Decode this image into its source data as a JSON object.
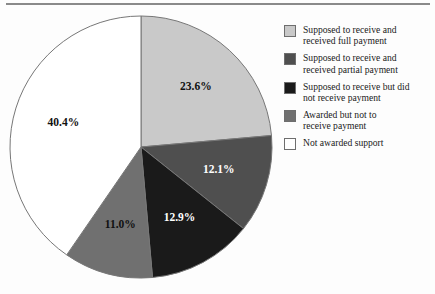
{
  "chart_data": {
    "type": "pie",
    "title": "",
    "subtitle": "",
    "xlabel": "",
    "ylabel": "",
    "legend_position": "right",
    "grid": false,
    "start_angle_deg": 90,
    "direction": "clockwise",
    "categories": [
      "Supposed to receive and received full payment",
      "Supposed to receive and received partial payment",
      "Supposed to receive but did not receive payment",
      "Awarded but not to receive payment",
      "Not awarded support"
    ],
    "values": [
      23.6,
      12.1,
      12.9,
      11.0,
      40.4
    ],
    "value_labels": [
      "23.6%",
      "12.1%",
      "12.9%",
      "11.0%",
      "40.4%"
    ],
    "colors": [
      "#c9c9c9",
      "#4f4f4f",
      "#1a1a1a",
      "#707070",
      "#ffffff"
    ],
    "label_text_colors": [
      "#111111",
      "#ffffff",
      "#ffffff",
      "#111111",
      "#111111"
    ],
    "slice_border_color": "#777777"
  },
  "legend": {
    "items": [
      {
        "label": "Supposed to receive and\nreceived full payment",
        "swatch": "#c9c9c9",
        "swatch_name": "legend-swatch-full-payment"
      },
      {
        "label": "Supposed to receive and\nreceived partial payment",
        "swatch": "#4f4f4f",
        "swatch_name": "legend-swatch-partial-payment"
      },
      {
        "label": "Supposed to receive but did\nnot receive payment",
        "swatch": "#1a1a1a",
        "swatch_name": "legend-swatch-no-payment"
      },
      {
        "label": "Awarded but not to\nreceive payment",
        "swatch": "#707070",
        "swatch_name": "legend-swatch-awarded-not-to-receive"
      },
      {
        "label": "Not awarded support",
        "swatch": "#ffffff",
        "swatch_name": "legend-swatch-not-awarded"
      }
    ]
  },
  "slice_labels": {
    "s0": "23.6%",
    "s1": "12.1%",
    "s2": "12.9%",
    "s3": "11.0%",
    "s4": "40.4%"
  }
}
